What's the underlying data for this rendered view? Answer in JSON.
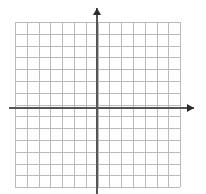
{
  "figure": {
    "kind": "coordinate-grid",
    "width": 206,
    "height": 194,
    "background_color": "#ffffff"
  },
  "chart_data": {
    "type": "scatter",
    "title": "",
    "subtitle": "",
    "xlabel": "",
    "ylabel": "",
    "x": [],
    "y": [],
    "series": [],
    "annotations": [],
    "legend": null,
    "legend_position": "none",
    "grid": true,
    "grid_color": "#b9b9b9",
    "grid_step": 1,
    "axis_color": "#555555",
    "arrow_color": "#2b2b2b",
    "xlim": [
      -7,
      7
    ],
    "ylim": [
      -7,
      7
    ],
    "x_tick_labels": [],
    "y_tick_labels": [],
    "x_columns": 14,
    "y_rows": 14,
    "origin_column_index": 7,
    "origin_row_index": 7,
    "x_axis_arrow": "positive-x",
    "y_axis_arrow": "positive-y"
  },
  "geometry": {
    "grid_left": 15,
    "grid_top": 22,
    "grid_right": 180,
    "grid_bottom": 187,
    "cell_size": 11.8,
    "origin_x": 97,
    "origin_y": 108,
    "x_axis_start": 9,
    "x_axis_end": 194,
    "y_axis_top": 8,
    "y_axis_bottom": 194
  }
}
